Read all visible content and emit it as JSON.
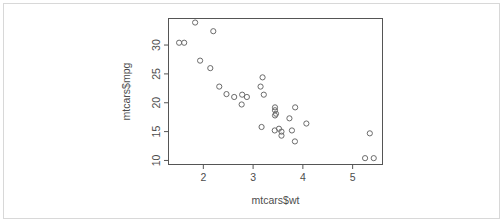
{
  "chart_data": {
    "type": "scatter",
    "title": "",
    "subtitle": "",
    "xlabel": "mtcars$wt",
    "ylabel": "mtcars$mpg",
    "xlim": [
      1.3,
      5.6
    ],
    "ylim": [
      9.3,
      34.6
    ],
    "xticks": [
      2,
      3,
      4,
      5
    ],
    "yticks": [
      10,
      15,
      20,
      25,
      30
    ],
    "xtick_labels": [
      "2",
      "3",
      "4",
      "5"
    ],
    "ytick_labels": [
      "10",
      "15",
      "20",
      "25",
      "30"
    ],
    "grid": false,
    "legend": false,
    "legend_position": "none",
    "marker": "open-circle",
    "marker_color": "#6b6b6b",
    "marker_radius": 2.6,
    "frame": "box",
    "series": [
      {
        "name": "mtcars",
        "x": [
          2.62,
          2.875,
          2.32,
          3.215,
          3.44,
          3.46,
          3.57,
          3.19,
          3.15,
          3.44,
          3.44,
          4.07,
          3.73,
          3.78,
          5.25,
          5.424,
          5.345,
          2.2,
          1.615,
          1.835,
          2.465,
          3.52,
          3.435,
          3.84,
          3.845,
          1.935,
          2.14,
          1.513,
          3.17,
          2.77,
          3.57,
          2.78
        ],
        "y": [
          21.0,
          21.0,
          22.8,
          21.4,
          18.7,
          18.1,
          14.3,
          24.4,
          22.8,
          19.2,
          17.8,
          16.4,
          17.3,
          15.2,
          10.4,
          10.4,
          14.7,
          32.4,
          30.4,
          33.9,
          21.5,
          15.5,
          15.2,
          13.3,
          19.2,
          27.3,
          26.0,
          30.4,
          15.8,
          19.7,
          15.0,
          21.4
        ]
      }
    ]
  },
  "axes": {
    "x_axis_name": "x-axis",
    "y_axis_name": "y-axis"
  }
}
